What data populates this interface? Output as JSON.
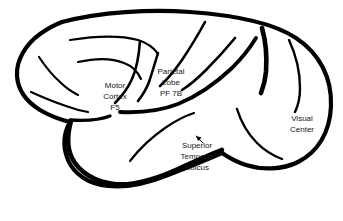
{
  "figure": {
    "kind": "brain-lateral-view-diagram",
    "background_color": "#ffffff",
    "ink_color": "#000000",
    "text_color": "#191919",
    "width": 343,
    "height": 221
  },
  "labels": {
    "motor_cortex": {
      "name": "motor-cortex-label",
      "lines": [
        "Motor",
        "Cortex",
        "F5"
      ],
      "x": 115,
      "y": 86,
      "line_height": 11
    },
    "parietal_lobe": {
      "name": "parietal-lobe-label",
      "lines": [
        "Parietal",
        "Lobe",
        "PF 7B"
      ],
      "x": 171,
      "y": 72,
      "line_height": 11
    },
    "superior_temporal_sulcus": {
      "name": "superior-temporal-sulcus-label",
      "lines": [
        "Superior",
        "Temporal",
        "Sulcus"
      ],
      "x": 197,
      "y": 146,
      "line_height": 11
    },
    "visual_center": {
      "name": "visual-center-label",
      "lines": [
        "Visual",
        "Center"
      ],
      "x": 302,
      "y": 119,
      "line_height": 11
    }
  },
  "annotations": {
    "sts_pointer": {
      "name": "superior-temporal-sulcus-pointer-arrow",
      "path": "M 196 136 L 203 143",
      "head": "M 196 136 L 201.6 137.4 L 198.1 140.9 Z"
    }
  },
  "shapes": {
    "cerebrum_outline": {
      "name": "cerebrum-outline",
      "stroke_width": 4.2,
      "path": "M 62 22 C 100 12 150 9 190 12 C 232 15 272 22 296 38 C 320 54 332 78 331 106 C 330 132 318 152 298 162 C 282 170 262 170 246 165 C 236 162 228 157 222 153 C 206 160 186 168 168 175 C 148 183 126 188 108 186 C 88 184 74 174 68 160 C 62 146 64 132 70 122 C 62 120 50 116 40 110 C 27 102 18 90 17 76 C 16 60 26 44 40 34 C 47 29 54 25 62 22 Z"
    },
    "temporal_outline": {
      "name": "temporal-lobe-outline",
      "stroke_width": 4.6,
      "path": "M 71 121 C 68 132 66 146 72 158 C 79 172 95 182 114 184 C 134 186 158 178 178 169 C 196 161 212 154 222 150"
    },
    "sylvian_fissure": {
      "name": "sylvian-fissure-stem",
      "stroke_width": 3.4,
      "path": "M 70 120 C 86 121 100 120 110 116"
    }
  },
  "sulci": [
    {
      "name": "frontal-superior-sulcus",
      "stroke_width": 2.2,
      "path": "M 70 40 C 95 36 120 35 138 40 C 148 43 154 48 158 54"
    },
    {
      "name": "frontal-middle-sulcus",
      "stroke_width": 2.2,
      "path": "M 78 62 C 96 58 112 58 124 63 C 132 66 138 72 141 79"
    },
    {
      "name": "frontal-inferior-sulcus",
      "stroke_width": 2.2,
      "path": "M 39 57 C 45 66 52 75 60 82 C 66 88 72 92 78 95"
    },
    {
      "name": "frontal-operculum-sulcus",
      "stroke_width": 2.2,
      "path": "M 31 92 C 42 97 54 102 66 106 C 74 109 82 111 88 112"
    },
    {
      "name": "precentral-sulcus",
      "stroke_width": 2.6,
      "path": "M 140 41 C 139 55 137 68 132 79 C 128 88 122 96 115 103"
    },
    {
      "name": "central-sulcus",
      "stroke_width": 2.6,
      "path": "M 158 53 C 155 63 152 73 149 82 C 146 90 142 96 138 101"
    },
    {
      "name": "postcentral-sulcus",
      "stroke_width": 2.6,
      "path": "M 205 22 C 198 35 190 48 182 60 C 175 70 168 79 160 86"
    },
    {
      "name": "intraparietal-sulcus",
      "stroke_width": 2.6,
      "path": "M 235 38 C 226 49 216 60 206 70 C 198 78 190 85 182 90"
    },
    {
      "name": "parieto-occipital-sulcus",
      "stroke_width": 4.6,
      "path": "M 262 28 C 266 42 267 58 266 72 C 265 82 263 88 261 93"
    },
    {
      "name": "lateral-occipital-sulcus",
      "stroke_width": 2.4,
      "path": "M 289 40 C 296 55 300 72 300 88 C 300 99 298 106 295 112"
    },
    {
      "name": "superior-temporal-sulcus-line",
      "stroke_width": 3.8,
      "path": "M 120 112 C 140 113 160 111 178 104 C 198 96 216 83 232 68 C 242 58 250 48 256 38"
    },
    {
      "name": "occipito-temporal-sulcus",
      "stroke_width": 2.4,
      "path": "M 237 109 C 241 122 248 134 257 143 C 265 151 274 156 282 159"
    },
    {
      "name": "inferior-temporal-sulcus",
      "stroke_width": 2.2,
      "path": "M 130 161 C 140 148 152 137 165 128 C 175 121 185 116 194 113"
    }
  ]
}
